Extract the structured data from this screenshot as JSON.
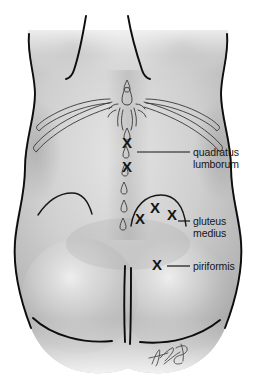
{
  "figure": {
    "orientation": "posterior",
    "style": "grayscale medical illustration",
    "background_color": "#ffffff",
    "skin_base_color": "#cfcfcf",
    "skin_shadow_color": "#8e8e8e",
    "skin_highlight_color": "#ededed",
    "outline_color": "#0d0d0d",
    "marker_color": "#141414",
    "label_color": "#161616"
  },
  "markers": {
    "glyph": "X",
    "points": [
      {
        "id": "ql-upper",
        "muscle": "quadratus lumborum",
        "x": 127,
        "y": 148
      },
      {
        "id": "ql-lower",
        "muscle": "quadratus lumborum",
        "x": 127,
        "y": 172
      },
      {
        "id": "gm-left",
        "muscle": "gluteus medius",
        "x": 140,
        "y": 224
      },
      {
        "id": "gm-mid",
        "muscle": "gluteus medius",
        "x": 155,
        "y": 213
      },
      {
        "id": "gm-right",
        "muscle": "gluteus medius",
        "x": 172,
        "y": 220
      },
      {
        "id": "pir-1",
        "muscle": "piriformis",
        "x": 157,
        "y": 270
      }
    ]
  },
  "labels": [
    {
      "id": "quadratus-lumborum",
      "lines": [
        "quadratus",
        "lumborum"
      ],
      "text": "quadratus lumborum",
      "text_x": 193,
      "line1_y": 156,
      "line2_y": 168,
      "leader": {
        "x1": 137,
        "y1": 152,
        "x2": 190,
        "y2": 152
      }
    },
    {
      "id": "gluteus-medius",
      "lines": [
        "gluteus",
        "medius"
      ],
      "text": "gluteus medius",
      "text_x": 193,
      "line1_y": 225,
      "line2_y": 237,
      "leader": {
        "x1": 178,
        "y1": 221,
        "x2": 190,
        "y2": 221
      }
    },
    {
      "id": "piriformis",
      "lines": [
        "piriformis"
      ],
      "text": "piriformis",
      "text_x": 193,
      "line1_y": 270,
      "line2_y": null,
      "leader": {
        "x1": 167,
        "y1": 266,
        "x2": 190,
        "y2": 266
      }
    }
  ],
  "anatomy": {
    "regions": [
      "upper back",
      "lumbar region",
      "iliac crest",
      "sacrum",
      "gluteal region"
    ],
    "landmark_notes": "twelfth rib pair, lumbar spinous processes, sacral dimples, gluteal fold, gluteal cleft"
  },
  "signature": {
    "present": true,
    "legible": false,
    "description": "artist cursive signature"
  }
}
